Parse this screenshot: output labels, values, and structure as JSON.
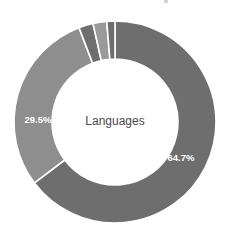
{
  "chart_data": {
    "type": "pie",
    "variant": "donut",
    "title": "Languages",
    "center_label": "Languages",
    "xlabel": "",
    "ylabel": "",
    "legend": "none",
    "grid": false,
    "start_angle_deg": -90,
    "direction": "clockwise",
    "units": "percent",
    "total": 100,
    "categories": [
      "Slice 1",
      "Slice 2",
      "Slice 3",
      "Slice 4",
      "Slice 5"
    ],
    "values": [
      64.7,
      29.5,
      2.3,
      2.2,
      1.3
    ],
    "labels": [
      "64.7%",
      "29.5%",
      "",
      "",
      ""
    ],
    "colors": [
      "#6e6e6e",
      "#8e8e8e",
      "#6e6e6e",
      "#9a9a9a",
      "#6e6e6e"
    ],
    "slices": [
      {
        "name": "slice-1",
        "value": 64.7,
        "label": "64.7%",
        "label_visible": true,
        "color": "#6e6e6e",
        "label_color": "#ffffff"
      },
      {
        "name": "slice-2",
        "value": 29.5,
        "label": "29.5%",
        "label_visible": true,
        "color": "#8e8e8e",
        "label_color": "#ffffff"
      },
      {
        "name": "slice-3",
        "value": 2.3,
        "label": "",
        "label_visible": false,
        "color": "#6e6e6e",
        "label_color": "#ffffff"
      },
      {
        "name": "slice-4",
        "value": 2.2,
        "label": "",
        "label_visible": false,
        "color": "#9a9a9a",
        "label_color": "#ffffff"
      },
      {
        "name": "slice-5",
        "value": 1.3,
        "label": "",
        "label_visible": false,
        "color": "#6e6e6e",
        "label_color": "#ffffff"
      }
    ]
  },
  "chart": {
    "center_x": 115,
    "center_y": 122,
    "outer_radius": 101,
    "inner_radius": 63,
    "separator_color": "#ffffff",
    "background": "#ffffff",
    "center_text": "Languages",
    "label_1": "64.7%",
    "label_2": "29.5%",
    "label_1_x": 181,
    "label_1_y": 158,
    "label_2_x": 38,
    "label_2_y": 120
  }
}
